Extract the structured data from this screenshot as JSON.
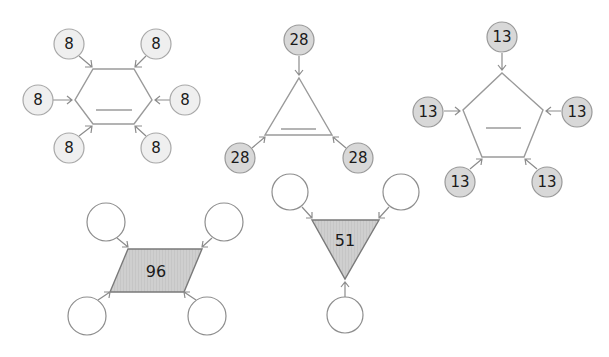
{
  "puzzles": [
    {
      "id": "hexagon",
      "shape": "hexagon",
      "center_value": "",
      "center_is_blank": true,
      "outer_values": [
        "8",
        "8",
        "8",
        "8",
        "8",
        "8"
      ]
    },
    {
      "id": "triangle-up",
      "shape": "triangle",
      "center_value": "",
      "center_is_blank": true,
      "outer_values": [
        "28",
        "28",
        "28"
      ]
    },
    {
      "id": "pentagon",
      "shape": "pentagon",
      "center_value": "",
      "center_is_blank": true,
      "outer_values": [
        "13",
        "13",
        "13",
        "13",
        "13"
      ]
    },
    {
      "id": "parallelogram",
      "shape": "parallelogram",
      "center_value": "96",
      "center_is_blank": false,
      "outer_values": [
        "",
        "",
        "",
        ""
      ]
    },
    {
      "id": "triangle-down",
      "shape": "inverted-triangle",
      "center_value": "51",
      "center_is_blank": false,
      "outer_values": [
        "",
        "",
        ""
      ]
    }
  ],
  "colors": {
    "light_circle_fill": "#efefef",
    "dark_circle_fill": "#d8d8d8",
    "shaded_shape_fill": "#cfcfcf",
    "stroke": "#9a9a9a"
  }
}
